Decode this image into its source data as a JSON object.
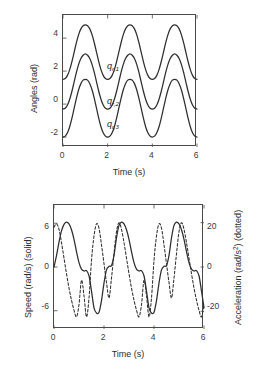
{
  "figure": {
    "background": "#ffffff",
    "line_color": "#2e2e2e",
    "axis_color": "#4a4a4a"
  },
  "chart_data": [
    {
      "id": "angles-plot",
      "type": "line",
      "title": "",
      "xlabel": "Time (s)",
      "ylabel": "Angles (rad)",
      "xlim": [
        0,
        6
      ],
      "ylim": [
        -2.6,
        5.4
      ],
      "xticks": [
        0,
        2,
        4,
        6
      ],
      "xticklabels": [
        "0",
        "2",
        "4",
        "6"
      ],
      "yticks": [
        -2,
        0,
        2,
        4
      ],
      "yticklabels": [
        "-2",
        "0",
        "2",
        "4"
      ],
      "grid": false,
      "legend": "inline-annotations",
      "series": [
        {
          "name": "q_{r,1}",
          "label_text": "q",
          "label_sub": "r,1",
          "label_x": 2.05,
          "label_y": 2.62,
          "style": "solid",
          "period": 2.0,
          "offset": 3.15,
          "amplitude": 1.65,
          "baseline": 1.5,
          "peak": 4.8,
          "trough": 1.5,
          "x": [
            0.0,
            0.1,
            0.2,
            0.3,
            0.4,
            0.5,
            0.6,
            0.7,
            0.8,
            0.9,
            1.0,
            1.1,
            1.2,
            1.3,
            1.4,
            1.5,
            1.6,
            1.7,
            1.8,
            1.9,
            2.0,
            2.1,
            2.2,
            2.3,
            2.4,
            2.5,
            2.6,
            2.7,
            2.8,
            2.9,
            3.0,
            3.1,
            3.2,
            3.3,
            3.4,
            3.5,
            3.6,
            3.7,
            3.8,
            3.9,
            4.0,
            4.1,
            4.2,
            4.3,
            4.4,
            4.5,
            4.6,
            4.7,
            4.8,
            4.9,
            5.0,
            5.1,
            5.2,
            5.3,
            5.4,
            5.5,
            5.6,
            5.7,
            5.8,
            5.9,
            6.0
          ],
          "y": [
            1.5,
            1.55,
            1.74,
            2.09,
            2.58,
            3.15,
            3.72,
            4.21,
            4.56,
            4.75,
            4.8,
            4.75,
            4.56,
            4.21,
            3.72,
            3.15,
            2.58,
            2.09,
            1.74,
            1.55,
            1.5,
            1.55,
            1.74,
            2.09,
            2.58,
            3.15,
            3.72,
            4.21,
            4.56,
            4.75,
            4.8,
            4.75,
            4.56,
            4.21,
            3.72,
            3.15,
            2.58,
            2.09,
            1.74,
            1.55,
            1.5,
            1.55,
            1.74,
            2.09,
            2.58,
            3.15,
            3.72,
            4.21,
            4.56,
            4.75,
            4.8,
            4.75,
            4.56,
            4.21,
            3.72,
            3.15,
            2.58,
            2.09,
            1.74,
            1.55,
            1.5
          ]
        },
        {
          "name": "q_{r,2}",
          "label_text": "q",
          "label_sub": "r,2",
          "label_x": 2.05,
          "label_y": 0.48,
          "style": "solid",
          "period": 2.0,
          "offset": 1.35,
          "amplitude": 1.65,
          "baseline": -0.3,
          "peak": 3.05,
          "trough": -0.3,
          "x": [
            0.0,
            0.1,
            0.2,
            0.3,
            0.4,
            0.5,
            0.6,
            0.7,
            0.8,
            0.9,
            1.0,
            1.1,
            1.2,
            1.3,
            1.4,
            1.5,
            1.6,
            1.7,
            1.8,
            1.9,
            2.0,
            2.1,
            2.2,
            2.3,
            2.4,
            2.5,
            2.6,
            2.7,
            2.8,
            2.9,
            3.0,
            3.1,
            3.2,
            3.3,
            3.4,
            3.5,
            3.6,
            3.7,
            3.8,
            3.9,
            4.0,
            4.1,
            4.2,
            4.3,
            4.4,
            4.5,
            4.6,
            4.7,
            4.8,
            4.9,
            5.0,
            5.1,
            5.2,
            5.3,
            5.4,
            5.5,
            5.6,
            5.7,
            5.8,
            5.9,
            6.0
          ],
          "y": [
            -0.3,
            -0.25,
            -0.06,
            0.29,
            0.78,
            1.35,
            1.92,
            2.41,
            2.76,
            2.96,
            3.05,
            2.96,
            2.76,
            2.41,
            1.92,
            1.35,
            0.78,
            0.29,
            -0.06,
            -0.25,
            -0.3,
            -0.25,
            -0.06,
            0.29,
            0.78,
            1.35,
            1.92,
            2.41,
            2.76,
            2.96,
            3.05,
            2.96,
            2.76,
            2.41,
            1.92,
            1.35,
            0.78,
            0.29,
            -0.06,
            -0.25,
            -0.3,
            -0.25,
            -0.06,
            0.29,
            0.78,
            1.35,
            1.92,
            2.41,
            2.76,
            2.96,
            3.05,
            2.96,
            2.76,
            2.41,
            1.92,
            1.35,
            0.78,
            0.29,
            -0.06,
            -0.25,
            -0.3
          ]
        },
        {
          "name": "q_{r,3}",
          "label_text": "q",
          "label_sub": "r,3",
          "label_x": 2.05,
          "label_y": -0.92,
          "style": "solid",
          "period": 2.0,
          "offset": -0.25,
          "amplitude": 1.75,
          "baseline": -2.0,
          "peak": 1.5,
          "trough": -2.0,
          "x": [
            0.0,
            0.1,
            0.2,
            0.3,
            0.4,
            0.5,
            0.6,
            0.7,
            0.8,
            0.9,
            1.0,
            1.1,
            1.2,
            1.3,
            1.4,
            1.5,
            1.6,
            1.7,
            1.8,
            1.9,
            2.0,
            2.1,
            2.2,
            2.3,
            2.4,
            2.5,
            2.6,
            2.7,
            2.8,
            2.9,
            3.0,
            3.1,
            3.2,
            3.3,
            3.4,
            3.5,
            3.6,
            3.7,
            3.8,
            3.9,
            4.0,
            4.1,
            4.2,
            4.3,
            4.4,
            4.5,
            4.6,
            4.7,
            4.8,
            4.9,
            5.0,
            5.1,
            5.2,
            5.3,
            5.4,
            5.5,
            5.6,
            5.7,
            5.8,
            5.9,
            6.0
          ],
          "y": [
            -2.0,
            -1.94,
            -1.74,
            -1.37,
            -0.85,
            -0.25,
            0.35,
            0.87,
            1.24,
            1.45,
            1.5,
            1.45,
            1.24,
            0.87,
            0.35,
            -0.25,
            -0.85,
            -1.37,
            -1.74,
            -1.94,
            -2.0,
            -1.94,
            -1.74,
            -1.37,
            -0.85,
            -0.25,
            0.35,
            0.87,
            1.24,
            1.45,
            1.5,
            1.45,
            1.24,
            0.87,
            0.35,
            -0.25,
            -0.85,
            -1.37,
            -1.74,
            -1.94,
            -2.0,
            -1.94,
            -1.74,
            -1.37,
            -0.85,
            -0.25,
            0.35,
            0.87,
            1.24,
            1.45,
            1.5,
            1.45,
            1.24,
            0.87,
            0.35,
            -0.25,
            -0.85,
            -1.37,
            -1.74,
            -1.94,
            -2.0
          ]
        }
      ]
    },
    {
      "id": "speed-acceleration-plot",
      "type": "line",
      "title": "",
      "xlabel": "Time (s)",
      "ylabel_left": "Speed (rad/s) (solid)",
      "ylabel_right_prefix": "Acceleration (rad/s",
      "ylabel_right_sup": "2",
      "ylabel_right_suffix": ") (dotted)",
      "xlim": [
        0,
        6
      ],
      "ylim_left": [
        -8.5,
        8.5
      ],
      "ylim_right": [
        -28,
        28
      ],
      "xticks": [
        0,
        2,
        4,
        6
      ],
      "xticklabels": [
        "0",
        "2",
        "4",
        "6"
      ],
      "yticks_left": [
        -6,
        0,
        6
      ],
      "yticklabels_left": [
        "-6",
        "0",
        "6"
      ],
      "yticks_right": [
        -20,
        0,
        20
      ],
      "yticklabels_right": [
        "-20",
        "0",
        "20"
      ],
      "grid": false,
      "series": [
        {
          "name": "Speed",
          "style": "solid",
          "axis": "left",
          "unit": "rad/s",
          "x": [
            0.0,
            0.1,
            0.2,
            0.3,
            0.4,
            0.5,
            0.6,
            0.7,
            0.8,
            0.9,
            1.0,
            1.1,
            1.2,
            1.3,
            1.4,
            1.5,
            1.6,
            1.7,
            1.8,
            1.9,
            2.0,
            2.1,
            2.2,
            2.3,
            2.4,
            2.5,
            2.6,
            2.7,
            2.8,
            2.9,
            3.0,
            3.1,
            3.2,
            3.3,
            3.4,
            3.5,
            3.6,
            3.7,
            3.8,
            3.9,
            4.0,
            4.1,
            4.2,
            4.3,
            4.4,
            4.5,
            4.6,
            4.7,
            4.8,
            4.9,
            5.0,
            5.1,
            5.2,
            5.3,
            5.4,
            5.5,
            5.6,
            5.7,
            5.8,
            5.9,
            6.0
          ],
          "y": [
            0.0,
            1.55,
            3.4,
            4.95,
            5.85,
            6.15,
            5.9,
            5.1,
            3.8,
            2.1,
            0.6,
            -0.3,
            -0.55,
            -0.5,
            -1.2,
            -3.3,
            -5.6,
            -6.3,
            -6.2,
            -4.6,
            -2.2,
            -0.4,
            0.1,
            0.2,
            1.6,
            4.0,
            5.7,
            6.15,
            5.9,
            5.1,
            3.8,
            2.1,
            0.6,
            -0.3,
            -0.55,
            -0.5,
            -1.2,
            -3.3,
            -5.6,
            -6.3,
            -6.2,
            -4.6,
            -2.2,
            -0.4,
            0.1,
            0.2,
            1.6,
            4.0,
            5.7,
            6.15,
            5.9,
            5.1,
            3.8,
            2.1,
            0.6,
            -0.3,
            -0.55,
            -0.5,
            -1.2,
            -3.3,
            -5.6
          ]
        },
        {
          "name": "Acceleration",
          "style": "dotted",
          "axis": "right",
          "unit": "rad/s^2",
          "x": [
            0.0,
            0.1,
            0.2,
            0.3,
            0.4,
            0.5,
            0.6,
            0.7,
            0.8,
            0.9,
            1.0,
            1.1,
            1.2,
            1.3,
            1.4,
            1.5,
            1.6,
            1.7,
            1.8,
            1.9,
            2.0,
            2.1,
            2.2,
            2.3,
            2.4,
            2.5,
            2.6,
            2.7,
            2.8,
            2.9,
            3.0,
            3.1,
            3.2,
            3.3,
            3.4,
            3.5,
            3.6,
            3.7,
            3.8,
            3.9,
            4.0,
            4.1,
            4.2,
            4.3,
            4.4,
            4.5,
            4.6,
            4.7,
            4.8,
            4.9,
            5.0,
            5.1,
            5.2,
            5.3,
            5.4,
            5.5,
            5.6,
            5.7,
            5.8,
            5.9,
            6.0
          ],
          "y": [
            18.0,
            19.5,
            17.0,
            11.0,
            4.0,
            -3.0,
            -9.5,
            -15.0,
            -19.5,
            -22.5,
            -17.0,
            -6.0,
            -13.0,
            -22.5,
            -14.0,
            3.0,
            14.0,
            19.5,
            17.5,
            10.0,
            1.5,
            -7.0,
            -14.0,
            -5.0,
            6.0,
            16.0,
            20.0,
            17.0,
            11.0,
            4.0,
            -3.0,
            -9.5,
            -15.0,
            -19.5,
            -22.5,
            -17.0,
            -6.0,
            -13.0,
            -22.5,
            -14.0,
            3.0,
            14.0,
            19.5,
            17.5,
            10.0,
            1.5,
            -7.0,
            -14.0,
            -5.0,
            6.0,
            16.0,
            20.0,
            17.0,
            11.0,
            4.0,
            -3.0,
            -9.5,
            -15.0,
            -19.5,
            -22.5,
            -17.0
          ]
        }
      ]
    }
  ]
}
